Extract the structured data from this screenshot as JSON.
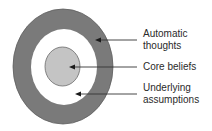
{
  "diagram": {
    "type": "concentric-circles",
    "colors": {
      "outer_ring": "#7a7a7a",
      "outer_ring_stroke": "#5e5e5e",
      "middle_area": "#ffffff",
      "core": "#c4c4c4",
      "core_stroke": "#6a6a6a",
      "arrow": "#333333",
      "text": "#2a2a2a"
    },
    "layers": [
      {
        "id": "outer",
        "label_line1": "Automatic",
        "label_line2": "thoughts"
      },
      {
        "id": "core",
        "label_line1": "Core beliefs",
        "label_line2": ""
      },
      {
        "id": "middle",
        "label_line1": "Underlying",
        "label_line2": "assumptions"
      }
    ]
  }
}
